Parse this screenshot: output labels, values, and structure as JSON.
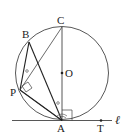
{
  "figure": {
    "type": "geometry",
    "points": {
      "C": {
        "label": "C",
        "x": 62,
        "y": 27
      },
      "O": {
        "label": "O",
        "x": 62,
        "y": 73
      },
      "A": {
        "label": "A",
        "x": 62,
        "y": 120
      },
      "B": {
        "label": "B",
        "x": 29,
        "y": 42
      },
      "P": {
        "label": "P",
        "x": 20,
        "y": 90
      },
      "T": {
        "label": "T",
        "x": 101,
        "y": 120
      }
    },
    "line_label": "ℓ",
    "circle": {
      "cx": 62,
      "cy": 73,
      "r": 46
    },
    "angle_marks": [
      "∘",
      "∘"
    ],
    "colors": {
      "stroke": "#333333",
      "background": "#ffffff"
    }
  }
}
